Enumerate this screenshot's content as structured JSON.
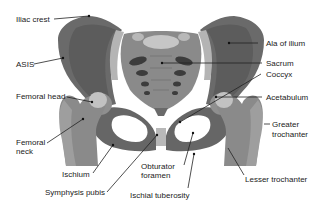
{
  "diagram": {
    "colors": {
      "bone_dark": "#5f5f5f",
      "bone_mid": "#767676",
      "bone_light": "#a9a9a9",
      "bone_highlight": "#c8c8c8",
      "leader_line": "#222222",
      "text": "#222222",
      "background": "#ffffff"
    },
    "labels": {
      "iliac_crest": "Iliac crest",
      "asis": "ASIS",
      "femoral_head": "Femoral head",
      "femoral_neck_1": "Femoral",
      "femoral_neck_2": "neck",
      "ischium": "Ischium",
      "symphysis_pubis": "Symphysis pubis",
      "obturator_foramen_1": "Obturator",
      "obturator_foramen_2": "foramen",
      "ischial_tuberosity": "Ischial tuberosity",
      "ala_of_ilium": "Ala of ilium",
      "sacrum": "Sacrum",
      "coccyx": "Coccyx",
      "acetabulum": "Acetabulum",
      "greater_trochanter_1": "Greater",
      "greater_trochanter_2": "trochanter",
      "lesser_trochanter": "Lesser trochanter"
    }
  }
}
